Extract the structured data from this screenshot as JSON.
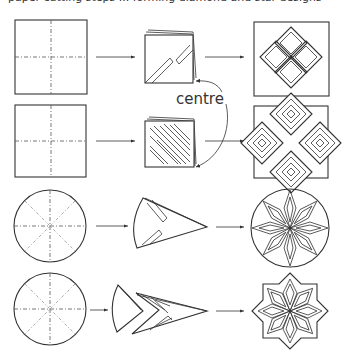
{
  "top_caption": "paper cutting steps ... forming diamond and star designs",
  "labels": {
    "centre": "centre"
  },
  "rows": [
    {
      "id": "row-1",
      "start_shape": "square",
      "step": "square folded in quarters, diagonal cuts",
      "result": "four diamonds in square"
    },
    {
      "id": "row-2",
      "start_shape": "square",
      "step": "square folded, parallel diagonal cuts",
      "result": "four nested diamonds cross"
    },
    {
      "id": "row-3",
      "start_shape": "circle",
      "step": "circle folded into cone, cuts",
      "result": "eight-point star in circle"
    },
    {
      "id": "row-4",
      "start_shape": "circle",
      "step": "cone with chevron cuts",
      "result": "eight-point star cut out"
    }
  ],
  "colors": {
    "stroke": "#333333",
    "background": "#ffffff"
  }
}
